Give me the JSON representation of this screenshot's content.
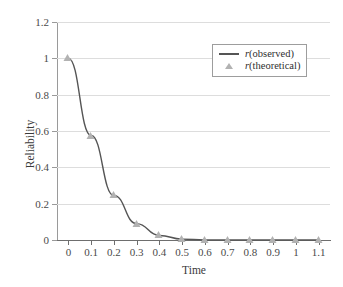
{
  "chart_data": {
    "type": "line",
    "title": "",
    "xlabel": "Time",
    "ylabel": "Reliability",
    "xlim": [
      -0.05,
      1.15
    ],
    "ylim": [
      0,
      1.2
    ],
    "grid": true,
    "legend_position": "top-right",
    "x_ticks": [
      "0",
      "0.1",
      "0.2",
      "0.3",
      "0.4",
      "0.5",
      "0.6",
      "0.7",
      "0.8",
      "0.9",
      "1",
      "1.1"
    ],
    "x_tick_values": [
      0,
      0.1,
      0.2,
      0.3,
      0.4,
      0.5,
      0.6,
      0.7,
      0.8,
      0.9,
      1.0,
      1.1
    ],
    "y_ticks": [
      "0",
      "0.2",
      "0.4",
      "0.6",
      "0.8",
      "1",
      "1.2"
    ],
    "y_tick_values": [
      0,
      0.2,
      0.4,
      0.6,
      0.8,
      1.0,
      1.2
    ],
    "x": [
      0,
      0.1,
      0.2,
      0.3,
      0.4,
      0.5,
      0.6,
      0.7,
      0.8,
      0.9,
      1.0,
      1.1
    ],
    "series": [
      {
        "name": "r(observed)",
        "style": "line",
        "color": "#555555",
        "values": [
          1.0,
          0.575,
          0.245,
          0.09,
          0.025,
          0.005,
          0.0,
          0.0,
          0.0,
          0.0,
          0.0,
          0.0
        ]
      },
      {
        "name": "r(theoretical)",
        "style": "marker-triangle",
        "color": "#b2b2b2",
        "values": [
          1.0,
          0.575,
          0.245,
          0.09,
          0.025,
          0.005,
          0.0,
          0.0,
          0.0,
          0.0,
          0.0,
          0.0
        ]
      }
    ]
  },
  "legend": {
    "entries": [
      {
        "label_prefix": "r",
        "label_suffix": "(observed)",
        "marker": "line-swatch"
      },
      {
        "label_prefix": "r",
        "label_suffix": "(theoretical)",
        "marker": "triangle-swatch"
      }
    ]
  },
  "colors": {
    "line": "#555555",
    "marker": "#b2b2b2",
    "grid": "#dddddd",
    "axis": "#6e6e6e",
    "text": "#3a3a3a",
    "background": "#ffffff"
  }
}
